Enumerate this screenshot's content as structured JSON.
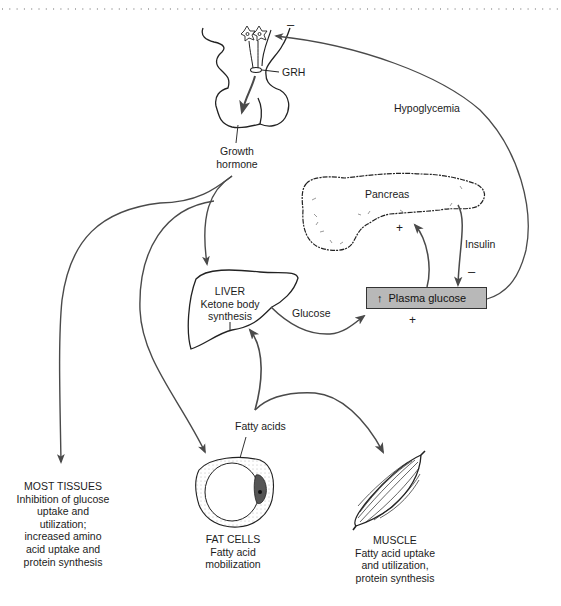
{
  "header": {
    "rule": "dotted"
  },
  "nodes": {
    "hypothalamus": {
      "releasing_hormone": "GRH",
      "feedback_sign": "–"
    },
    "pituitary": {
      "output": "Growth hormone",
      "output_line1": "Growth",
      "output_line2": "hormone"
    },
    "pancreas": {
      "label": "Pancreas",
      "stimulus_sign": "+"
    },
    "insulin": {
      "label": "Insulin",
      "sign": "–"
    },
    "plasma_glucose": {
      "arrow": "↑",
      "label": "Plasma glucose",
      "input_sign": "+"
    },
    "hypoglycemia": {
      "label": "Hypoglycemia"
    },
    "liver": {
      "title": "LIVER",
      "line1": "Ketone body",
      "line2": "synthesis",
      "output": "Glucose"
    },
    "fatty_acids": {
      "label": "Fatty acids"
    },
    "most_tissues": {
      "title": "MOST TISSUES",
      "lines": [
        "Inhibition of glucose",
        "uptake and",
        "utilization;",
        "increased amino",
        "acid uptake and",
        "protein synthesis"
      ]
    },
    "fat_cells": {
      "title": "FAT CELLS",
      "lines": [
        "Fatty acid",
        "mobilization"
      ]
    },
    "muscle": {
      "title": "MUSCLE",
      "lines": [
        "Fatty acid uptake",
        "and utilization,",
        "protein synthesis"
      ]
    }
  },
  "colors": {
    "line": "#4a4a4a",
    "box_fill": "#b8b8b8",
    "text": "#1c1c1c"
  }
}
